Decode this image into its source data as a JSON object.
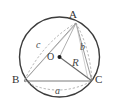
{
  "figure": {
    "type": "geometry-diagram",
    "background_color": "#ffffff",
    "width": 113,
    "height": 112
  },
  "circle": {
    "name": "circumcircle",
    "center_x": 59.5,
    "center_y": 57,
    "radius": 40,
    "stroke_color": "#3c3c3c",
    "stroke_width": 1.4,
    "fill": "none"
  },
  "center_point": {
    "label": "O",
    "dot_x": 59.5,
    "dot_y": 57,
    "dot_radius": 2.0,
    "dot_color": "#1a1a1a",
    "label_x": 47,
    "label_y": 52
  },
  "vertices": [
    {
      "label": "A",
      "x": 76,
      "y": 23,
      "label_x": 69,
      "label_y": 9
    },
    {
      "label": "B",
      "x": 24,
      "y": 81,
      "label_x": 12,
      "label_y": 75
    },
    {
      "label": "C",
      "x": 92,
      "y": 81,
      "label_x": 94,
      "label_y": 75
    }
  ],
  "sides": [
    {
      "label": "a",
      "name": "side-a",
      "from": "B",
      "to": "C",
      "style": "dashed-arc",
      "label_x": 55,
      "label_y": 87,
      "stroke_color": "#9a9a9a"
    },
    {
      "label": "b",
      "name": "side-b",
      "from": "C",
      "to": "A",
      "style": "dashed-arc",
      "label_x": 80,
      "label_y": 42,
      "stroke_color": "#9a9a9a"
    },
    {
      "label": "c",
      "name": "side-c",
      "from": "A",
      "to": "B",
      "style": "dashed-arc",
      "label_x": 36,
      "label_y": 40,
      "stroke_color": "#9a9a9a"
    }
  ],
  "radius_segment": {
    "label": "R",
    "from": "O",
    "to": "C",
    "stroke_color": "#6a6a6a",
    "stroke_width": 1.1,
    "label_x": 72,
    "label_y": 58
  },
  "triangle": {
    "name": "triangle-ABC",
    "base_stroke_color": "#7a7a7a",
    "base_stroke_width": 1.0,
    "leg_stroke_color": "#8a8a8a",
    "leg_stroke_width": 0.9
  },
  "colors": {
    "outline": "#3c3c3c",
    "dashed": "#9a9a9a",
    "text": "#3a3a3a",
    "accent": "#1a1a1a"
  }
}
